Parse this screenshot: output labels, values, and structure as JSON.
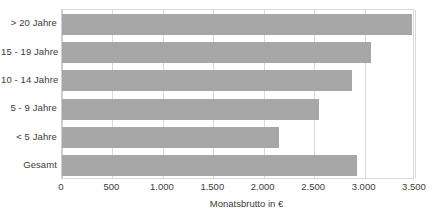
{
  "chart_data": {
    "type": "bar",
    "orientation": "horizontal",
    "title": "",
    "subtitle": "",
    "xlabel": "Monatsbrutto in €",
    "ylabel": "",
    "categories": [
      "> 20 Jahre",
      "15 - 19 Jahre",
      "10 - 14 Jahre",
      "5 - 9 Jahre",
      "< 5 Jahre",
      "Gesamt"
    ],
    "values": [
      3470,
      3060,
      2880,
      2550,
      2150,
      2920
    ],
    "series": [
      {
        "name": "Monatsbrutto",
        "values": [
          3470,
          3060,
          2880,
          2550,
          2150,
          2920
        ]
      }
    ],
    "xlim": [
      0,
      3500
    ],
    "xticks": [
      0,
      500,
      1000,
      1500,
      2000,
      2500,
      3000,
      3500
    ],
    "xtick_labels": [
      "0",
      "500",
      "1.000",
      "1.500",
      "2.000",
      "2.500",
      "3.000",
      "3.500"
    ],
    "grid": true,
    "grid_axis": "x",
    "legend": false,
    "legend_position": "none",
    "bar_color": "#a7a7a7",
    "grid_color": "#d9d9d9",
    "text_color": "#3b3b3b",
    "background": "#ffffff"
  }
}
